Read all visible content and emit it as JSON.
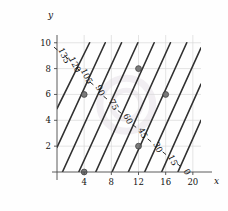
{
  "chart_data": {
    "type": "line",
    "title": "",
    "subtitle": "",
    "xlabel": "x",
    "ylabel": "y",
    "xlim": [
      0,
      21.2
    ],
    "ylim": [
      0,
      10.6
    ],
    "grid": true,
    "legend": "none",
    "plot_kind": "contour",
    "xticks": [
      4,
      8,
      12,
      16,
      20
    ],
    "yticks": [
      2,
      4,
      6,
      8,
      10
    ],
    "contour_levels": [
      0,
      15,
      30,
      45,
      60,
      75,
      90,
      105,
      120,
      135
    ],
    "contour_step": 15,
    "contour_labels": [
      "0",
      "15",
      "30",
      "45",
      "60",
      "75",
      "90",
      "105",
      "120",
      "135"
    ],
    "series": [
      {
        "name": "135",
        "level": 135,
        "x": [
          0.0,
          4.8
        ],
        "y": [
          4.9,
          10.0
        ]
      },
      {
        "name": "120",
        "level": 120,
        "x": [
          0.0,
          7.1
        ],
        "y": [
          1.9,
          10.0
        ]
      },
      {
        "name": "105",
        "level": 105,
        "x": [
          0.8,
          9.5
        ],
        "y": [
          0.0,
          10.0
        ]
      },
      {
        "name": "90",
        "level": 90,
        "x": [
          3.2,
          11.9
        ],
        "y": [
          0.0,
          10.0
        ]
      },
      {
        "name": "75",
        "level": 75,
        "x": [
          5.7,
          14.3
        ],
        "y": [
          0.0,
          10.0
        ]
      },
      {
        "name": "60",
        "level": 60,
        "x": [
          8.1,
          16.7
        ],
        "y": [
          0.0,
          10.0
        ]
      },
      {
        "name": "45",
        "level": 45,
        "x": [
          10.5,
          19.1
        ],
        "y": [
          0.0,
          10.0
        ]
      },
      {
        "name": "30",
        "level": 30,
        "x": [
          12.9,
          21.2
        ],
        "y": [
          0.0,
          9.6
        ]
      },
      {
        "name": "15",
        "level": 15,
        "x": [
          15.4,
          21.2
        ],
        "y": [
          0.0,
          6.8
        ]
      },
      {
        "name": "0",
        "level": 0,
        "x": [
          17.8,
          21.2
        ],
        "y": [
          0.0,
          4.0
        ]
      }
    ],
    "label_positions": [
      {
        "text": "135",
        "x": 1.0,
        "y": 9.0
      },
      {
        "text": "120",
        "x": 2.6,
        "y": 8.3
      },
      {
        "text": "105",
        "x": 4.3,
        "y": 7.4
      },
      {
        "text": "90",
        "x": 6.3,
        "y": 6.3
      },
      {
        "text": "75",
        "x": 8.3,
        "y": 5.2
      },
      {
        "text": "60",
        "x": 10.4,
        "y": 4.1
      },
      {
        "text": "45",
        "x": 12.6,
        "y": 3.0
      },
      {
        "text": "30",
        "x": 14.8,
        "y": 1.9
      },
      {
        "text": "15",
        "x": 17.0,
        "y": 0.9
      },
      {
        "text": "0",
        "x": 19.1,
        "y": 0.0
      }
    ],
    "points": [
      {
        "x": 4,
        "y": 6
      },
      {
        "x": 12,
        "y": 8
      },
      {
        "x": 16,
        "y": 6
      },
      {
        "x": 12,
        "y": 2
      },
      {
        "x": 4,
        "y": 0
      }
    ],
    "colors": {
      "contour_line": "#303030",
      "grid": "#d8d8d8",
      "axis": "#4a4a4a",
      "point": "#6f6f6f",
      "point_edge": "#3a3a3a",
      "text": "#111111",
      "watermark": "#f1eef2",
      "background": "#fefefe"
    },
    "watermark": {
      "shape": "circle",
      "cx": 10.2,
      "cy": 5.2,
      "r": 3.9
    }
  }
}
